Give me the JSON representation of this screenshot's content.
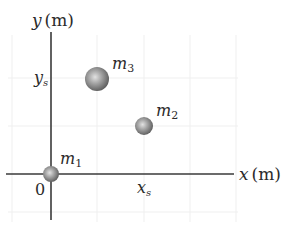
{
  "diagram": {
    "axes": {
      "x_label": "x (m)",
      "y_label": "y (m)",
      "origin_label": "0",
      "x_tick_label": "x",
      "x_tick_sub": "s",
      "y_tick_label": "y",
      "y_tick_sub": "s"
    },
    "masses": [
      {
        "name": "m",
        "sub": "1",
        "position": "origin"
      },
      {
        "name": "m",
        "sub": "2",
        "position": "(x_s, y_s/2)"
      },
      {
        "name": "m",
        "sub": "3",
        "position": "(x_s/2, y_s)"
      }
    ],
    "colors": {
      "axis": "#3a3a3a",
      "grid": "#ededed",
      "sphere_light": "#d9d9d9",
      "sphere_mid": "#9a9a9a",
      "sphere_dark": "#5c5c5c"
    }
  }
}
